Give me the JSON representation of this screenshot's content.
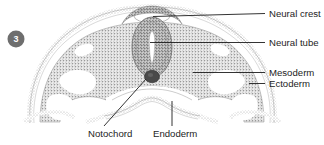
{
  "figure": {
    "step_badge": "3",
    "colors": {
      "stipple_gray": "#a9a9a9",
      "stipple_dark": "#8c8c8c",
      "notochord_dark": "#4a4a4a",
      "badge_gray": "#6e6e6e",
      "leader_black": "#1d1d1d",
      "background": "#ffffff"
    }
  },
  "labels": {
    "neural_crest": "Neural crest",
    "neural_tube": "Neural tube",
    "mesoderm": "Mesoderm",
    "ectoderm": "Ectoderm",
    "notochord": "Notochord",
    "endoderm": "Endoderm"
  }
}
